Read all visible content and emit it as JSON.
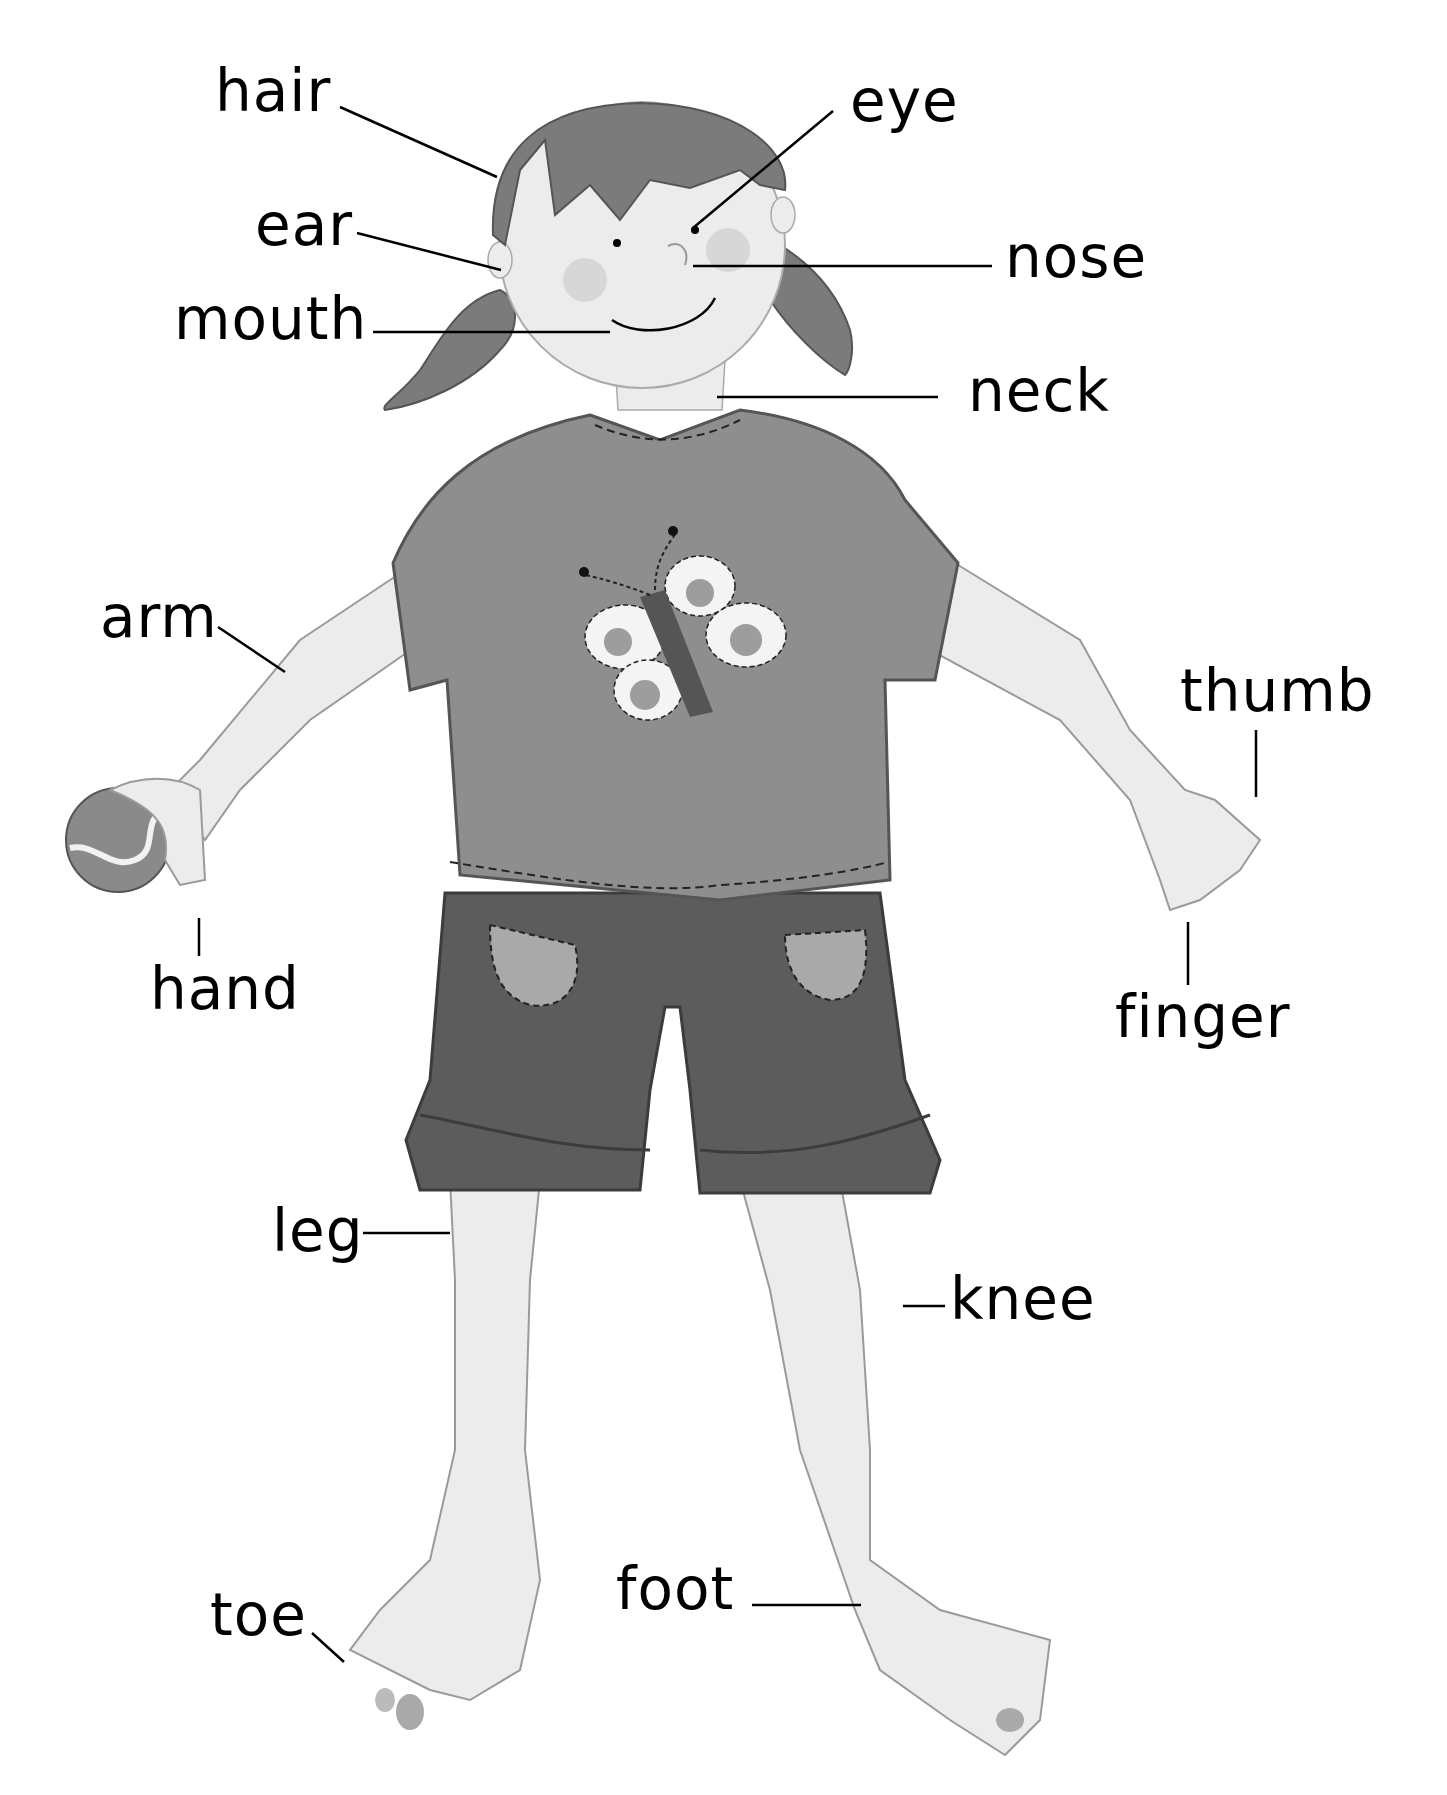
{
  "diagram": {
    "colors": {
      "background": "#ffffff",
      "text": "#000000",
      "skin": "#ececec",
      "skin_outline": "#9a9a9a",
      "hair": "#7b7b7b",
      "shirt": "#8e8e8e",
      "shorts": "#5c5c5c",
      "pocket": "#a9a9a9",
      "butterfly_wing": "#f4f4f4",
      "butterfly_spot": "#9d9d9d",
      "butterfly_body": "#555555",
      "ball": "#8a8a8a",
      "leader_line": "#000000"
    },
    "labels": [
      {
        "id": "hair",
        "text": "hair",
        "x": 215,
        "y": 62
      },
      {
        "id": "eye",
        "text": "eye",
        "x": 850,
        "y": 72
      },
      {
        "id": "ear",
        "text": "ear",
        "x": 255,
        "y": 196
      },
      {
        "id": "nose",
        "text": "nose",
        "x": 1005,
        "y": 228
      },
      {
        "id": "mouth",
        "text": "mouth",
        "x": 174,
        "y": 290
      },
      {
        "id": "neck",
        "text": "neck",
        "x": 968,
        "y": 362
      },
      {
        "id": "arm",
        "text": "arm",
        "x": 100,
        "y": 588
      },
      {
        "id": "thumb",
        "text": "thumb",
        "x": 1180,
        "y": 662
      },
      {
        "id": "hand",
        "text": "hand",
        "x": 150,
        "y": 960
      },
      {
        "id": "finger",
        "text": "finger",
        "x": 1115,
        "y": 988
      },
      {
        "id": "leg",
        "text": "leg",
        "x": 272,
        "y": 1202
      },
      {
        "id": "knee",
        "text": "knee",
        "x": 950,
        "y": 1270
      },
      {
        "id": "toe",
        "text": "toe",
        "x": 210,
        "y": 1586
      },
      {
        "id": "foot",
        "text": "foot",
        "x": 616,
        "y": 1560
      }
    ]
  }
}
